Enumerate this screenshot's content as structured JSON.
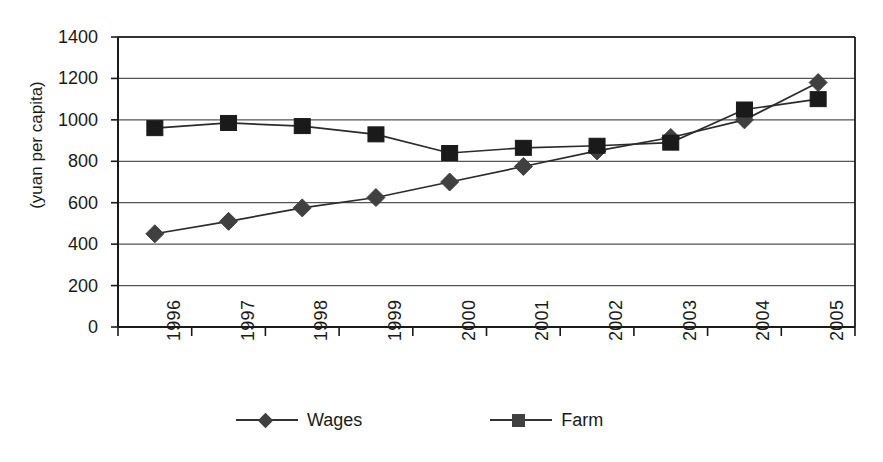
{
  "chart_data": {
    "type": "line",
    "title": "",
    "xlabel": "",
    "ylabel": "(yuan per capita)",
    "categories": [
      "1996",
      "1997",
      "1998",
      "1999",
      "2000",
      "2001",
      "2002",
      "2003",
      "2004",
      "2005"
    ],
    "series": [
      {
        "name": "Wages",
        "marker": "diamond",
        "color": "#404040",
        "values": [
          450,
          510,
          575,
          625,
          700,
          775,
          850,
          915,
          1000,
          1180
        ]
      },
      {
        "name": "Farm",
        "marker": "square",
        "color": "#1a1a1a",
        "values": [
          960,
          985,
          970,
          930,
          840,
          865,
          875,
          890,
          1050,
          1100
        ]
      }
    ],
    "ylim": [
      0,
      1400
    ],
    "ytick_step": 200,
    "yticks": [
      "1400",
      "1200",
      "1000",
      "800",
      "600",
      "400",
      "200",
      "0"
    ],
    "grid": true,
    "grid_axis": "y",
    "legend_position": "bottom",
    "legend": [
      "Wages",
      "Farm"
    ],
    "axis_color": "#1a1a1a",
    "grid_color": "#555555",
    "background": "#ffffff"
  }
}
